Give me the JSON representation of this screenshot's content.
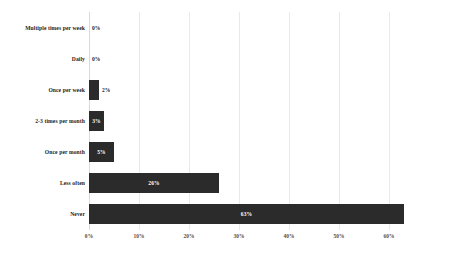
{
  "chart_data": {
    "type": "bar",
    "orientation": "horizontal",
    "title": "",
    "subtitle": "",
    "xlabel": "",
    "ylabel": "",
    "categories": [
      "Multiple times per week",
      "Daily",
      "Once per week",
      "2-3 times per month",
      "Once per month",
      "Less often",
      "Never"
    ],
    "values": [
      0,
      0,
      2,
      3,
      5,
      26,
      63
    ],
    "data_labels": [
      "0%",
      "0%",
      "2%",
      "3%",
      "5%",
      "26%",
      "63%"
    ],
    "xlim": [
      0,
      70
    ],
    "xticks": [
      0,
      10,
      20,
      30,
      40,
      50,
      60
    ],
    "xtick_labels": [
      "0%",
      "10%",
      "20%",
      "30%",
      "40%",
      "50%",
      "60%"
    ],
    "grid": true,
    "grid_axis": "x",
    "legend": false,
    "legend_position": "none",
    "bar_color": "#2b2b2b",
    "background_color": "#ffffff",
    "gridline_color": "#e9e9e9",
    "label_text_color_inside": "#ffffff",
    "label_text_color_outside": "#1d1d1d"
  }
}
